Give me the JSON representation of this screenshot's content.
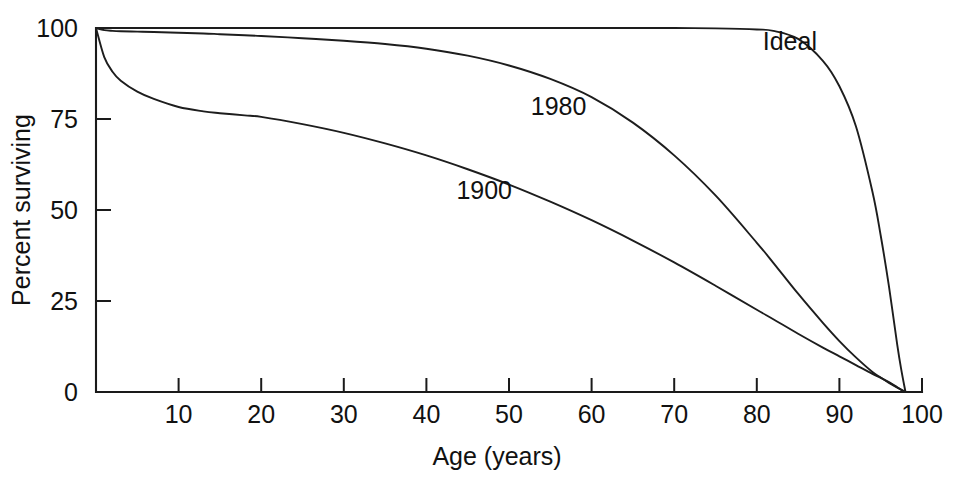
{
  "chart_data": {
    "type": "line",
    "title": "",
    "subtitle": "",
    "xlabel": "Age (years)",
    "ylabel": "Percent surviving",
    "xlim": [
      0,
      100
    ],
    "ylim": [
      0,
      100
    ],
    "grid": false,
    "legend_position": "inline-curve-labels",
    "x_ticks": [
      10,
      20,
      30,
      40,
      50,
      60,
      70,
      80,
      90,
      100
    ],
    "x_tick_labels": [
      "10",
      "20",
      "30",
      "40",
      "50",
      "60",
      "70",
      "80",
      "90",
      "100"
    ],
    "y_ticks": [
      0,
      25,
      50,
      75,
      100
    ],
    "y_tick_labels": [
      "0",
      "25",
      "50",
      "75",
      "100"
    ],
    "x": [
      0,
      1,
      2,
      3,
      5,
      7,
      10,
      13,
      15,
      18,
      20,
      25,
      30,
      35,
      40,
      45,
      50,
      55,
      60,
      65,
      70,
      75,
      80,
      82,
      85,
      88,
      90,
      92,
      94,
      95,
      96,
      97,
      97.5,
      98
    ],
    "series": [
      {
        "name": "Ideal",
        "label": "Ideal",
        "label_x": 84,
        "label_y": 94,
        "values": [
          100,
          100,
          100,
          100,
          100,
          100,
          100,
          100,
          100,
          100,
          100,
          100,
          100,
          100,
          100,
          100,
          100,
          100,
          100,
          100,
          100,
          99.9,
          99.6,
          99.2,
          97.0,
          91.0,
          84.0,
          73.0,
          55.0,
          43.0,
          29.0,
          13.0,
          6.0,
          0
        ]
      },
      {
        "name": "1980",
        "label": "1980",
        "label_x": 56,
        "label_y": 76,
        "values": [
          100,
          99.4,
          99.2,
          99.1,
          99.0,
          98.9,
          98.7,
          98.5,
          98.3,
          98.0,
          97.8,
          97.2,
          96.5,
          95.6,
          94.3,
          92.4,
          89.7,
          86.0,
          81.0,
          74.0,
          65.0,
          54.0,
          41.0,
          35.5,
          27.0,
          19.0,
          14.0,
          9.5,
          5.5,
          4.0,
          2.5,
          1.2,
          0.6,
          0
        ]
      },
      {
        "name": "1900",
        "label": "1900",
        "label_x": 47,
        "label_y": 53,
        "values": [
          100,
          92.0,
          88.0,
          85.5,
          82.5,
          80.5,
          78.3,
          77.1,
          76.6,
          76.0,
          75.6,
          73.6,
          71.2,
          68.3,
          65.0,
          61.2,
          57.0,
          52.3,
          47.2,
          41.6,
          35.6,
          29.2,
          22.6,
          20.0,
          16.0,
          12.2,
          9.8,
          7.4,
          5.0,
          3.9,
          2.7,
          1.3,
          0.6,
          0
        ]
      }
    ]
  },
  "axes": {
    "y_title": "Percent surviving",
    "x_title": "Age (years)"
  }
}
